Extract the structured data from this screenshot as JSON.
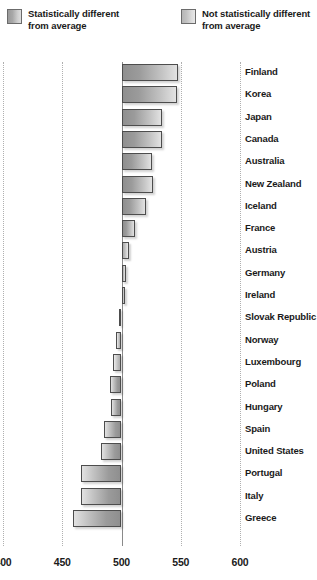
{
  "legend": {
    "items": [
      {
        "label_line1": "Statistically different",
        "label_line2": "from average",
        "swatch": "significant-swatch",
        "color": "#a8a8a8"
      },
      {
        "label_line1": "Not statistically different",
        "label_line2": "from average",
        "swatch": "not-significant-swatch",
        "color": "#c8c8c8"
      }
    ]
  },
  "chart_data": {
    "type": "bar",
    "orientation": "horizontal",
    "title": "",
    "subtitle": "",
    "xlabel": "",
    "ylabel": "",
    "xlim": [
      400,
      600
    ],
    "baseline": 500,
    "grid": true,
    "grid_axis": "x",
    "legend_position": "top",
    "xticks": [
      400,
      450,
      500,
      550,
      600
    ],
    "xtick_labels": [
      "400",
      "450",
      "500",
      "550",
      "600"
    ],
    "categories": [
      "Finland",
      "Korea",
      "Japan",
      "Canada",
      "Australia",
      "New Zealand",
      "Iceland",
      "France",
      "Austria",
      "Germany",
      "Ireland",
      "Slovak Republic",
      "Norway",
      "Luxembourg",
      "Poland",
      "Hungary",
      "Spain",
      "United States",
      "Portugal",
      "Italy",
      "Greece"
    ],
    "values": [
      548,
      547,
      534,
      534,
      526,
      527,
      521,
      511,
      506,
      504,
      503,
      498,
      495,
      493,
      490,
      491,
      485,
      483,
      466,
      466,
      459
    ],
    "series": [
      {
        "name": "Mean score",
        "values": [
          548,
          547,
          534,
          534,
          526,
          527,
          521,
          511,
          506,
          504,
          503,
          498,
          495,
          493,
          490,
          491,
          485,
          483,
          466,
          466,
          459
        ],
        "significance": [
          "significant",
          "significant",
          "significant",
          "significant",
          "significant",
          "significant",
          "significant",
          "significant",
          "not-significant",
          "not-significant",
          "not-significant",
          "not-significant",
          "not-significant",
          "not-significant",
          "significant",
          "significant",
          "significant",
          "significant",
          "significant",
          "significant",
          "significant"
        ]
      }
    ]
  }
}
